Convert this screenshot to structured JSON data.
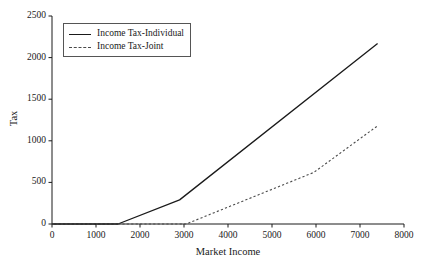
{
  "chart_data": {
    "type": "line",
    "title": "",
    "xlabel": "Market Income",
    "ylabel": "Tax",
    "xlim": [
      0,
      8000
    ],
    "ylim": [
      0,
      2500
    ],
    "xticks": [
      0,
      1000,
      2000,
      3000,
      4000,
      5000,
      6000,
      7000,
      8000
    ],
    "yticks": [
      0,
      500,
      1000,
      1500,
      2000,
      2500
    ],
    "xtick_labels": [
      "0",
      "1000",
      "2000",
      "3000",
      "4000",
      "5000",
      "6000",
      "7000",
      "8000"
    ],
    "ytick_labels": [
      "0",
      "500",
      "1000",
      "1500",
      "2000",
      "2500"
    ],
    "grid": false,
    "legend_position": "upper left",
    "series": [
      {
        "name": "Income Tax-Individual",
        "style": "solid",
        "color": "#1a1a1a",
        "x": [
          0,
          1500,
          2900,
          7400
        ],
        "y": [
          0,
          0,
          290,
          2170
        ]
      },
      {
        "name": "Income Tax-Joint",
        "style": "dashed",
        "color": "#4a4a4a",
        "x": [
          0,
          3050,
          5950,
          7400
        ],
        "y": [
          0,
          0,
          620,
          1180
        ]
      }
    ]
  },
  "axes": {
    "x_title": "Market Income",
    "y_title": "Tax"
  },
  "legend": {
    "entries": [
      {
        "label": "Income Tax-Individual",
        "style": "solid"
      },
      {
        "label": "Income Tax-Joint",
        "style": "dashed"
      }
    ]
  }
}
